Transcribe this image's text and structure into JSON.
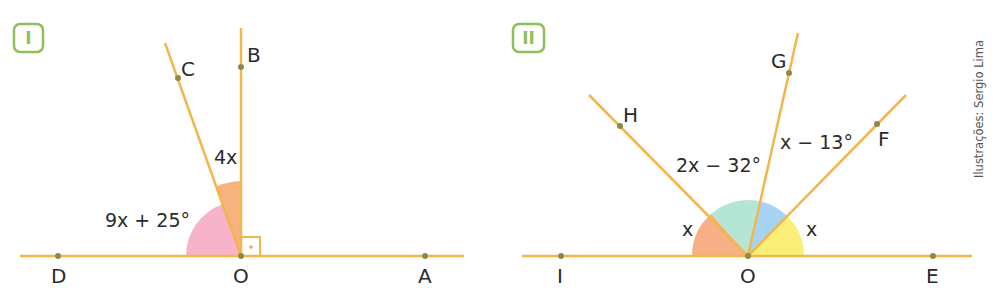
{
  "figures": [
    {
      "id": "I",
      "badge_label": "I",
      "center_label": "O",
      "points": [
        {
          "name": "D",
          "label": "D"
        },
        {
          "name": "A",
          "label": "A"
        },
        {
          "name": "B",
          "label": "B"
        },
        {
          "name": "C",
          "label": "C"
        }
      ],
      "angles": [
        {
          "name": "DOC",
          "label": "9x + 25°",
          "color": "#f6b3c9"
        },
        {
          "name": "COB",
          "label": "4x",
          "color": "#f7b27d"
        },
        {
          "name": "BOA",
          "label": "right angle",
          "marker": "square-with-dot"
        }
      ]
    },
    {
      "id": "II",
      "badge_label": "II",
      "center_label": "O",
      "points": [
        {
          "name": "I",
          "label": "I"
        },
        {
          "name": "E",
          "label": "E"
        },
        {
          "name": "H",
          "label": "H"
        },
        {
          "name": "G",
          "label": "G"
        },
        {
          "name": "F",
          "label": "F"
        }
      ],
      "angles": [
        {
          "name": "IOH",
          "label": "x",
          "color": "#f7b086"
        },
        {
          "name": "HOG",
          "label": "2x − 32°",
          "color": "#b5e6d5"
        },
        {
          "name": "GOF",
          "label": "x − 13°",
          "color": "#a9d3f2"
        },
        {
          "name": "FOE",
          "label": "x",
          "color": "#fbef7a"
        }
      ]
    }
  ],
  "credit": "Ilustrações: Sergio Lima",
  "colors": {
    "line": "#f2b64d",
    "point": "#8a8a4a",
    "badge": "#8cc05a",
    "text": "#2b2b2b"
  }
}
